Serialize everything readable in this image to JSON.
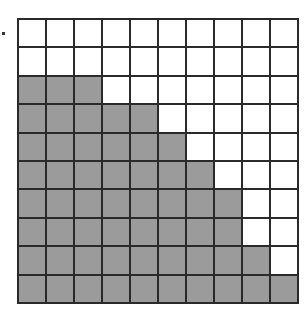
{
  "diagram": {
    "type": "hundred-grid",
    "rows": 10,
    "cols": 10,
    "shaded_per_row": [
      0,
      0,
      3,
      5,
      6,
      7,
      8,
      8,
      9,
      10
    ],
    "total_shaded": 56,
    "total_cells": 100,
    "colors": {
      "shaded": "#9b9b9b",
      "unshaded": "#ffffff",
      "lines": "#2a2a2a"
    }
  }
}
